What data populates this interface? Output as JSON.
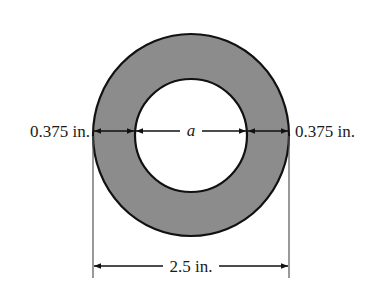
{
  "diagram": {
    "type": "hollow-circular-cross-section",
    "labels": {
      "left_wall": "0.375 in.",
      "right_wall": "0.375 in.",
      "inner_diameter": "a",
      "outer_diameter": "2.5 in."
    },
    "colors": {
      "ring_fill": "#8c8c8c",
      "stroke": "#111111",
      "extension_line": "#555555",
      "background": "#ffffff"
    }
  }
}
